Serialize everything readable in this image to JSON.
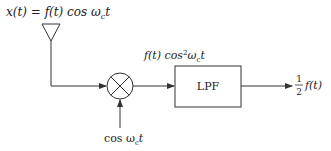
{
  "diagram": {
    "input_label": "x(t) = f(t) cos ω_c t",
    "input_parts": {
      "lhs": "x(t) = f(t) cos ω",
      "sub": "c",
      "rhs": "t"
    },
    "mixer_output_label": {
      "main": "f(t) cos",
      "sup": "2",
      "w": "ω",
      "sub": "c",
      "t": "t"
    },
    "local_oscillator_label": {
      "main": "cos ω",
      "sub": "c",
      "t": "t"
    },
    "filter_label": "LPF",
    "output_label": {
      "num": "1",
      "den": "2",
      "expr": "f(t)"
    },
    "colors": {
      "line": "#333333",
      "background": "#ffffff"
    }
  }
}
